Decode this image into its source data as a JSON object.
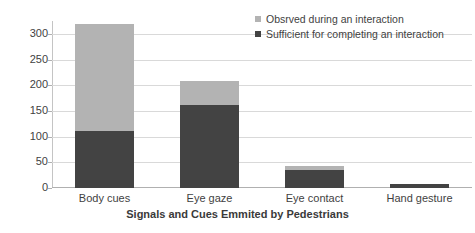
{
  "chart_data": {
    "type": "bar",
    "subtype": "stacked-bar",
    "title": "",
    "xlabel": "Signals and Cues Emmited by Pedestrians",
    "ylabel": "",
    "categories": [
      "Body cues",
      "Eye gaze",
      "Eye contact",
      "Hand gesture"
    ],
    "series": [
      {
        "name": "Sufficient for completing an interaction",
        "color": "#434343",
        "values": [
          110,
          161,
          36,
          7
        ]
      },
      {
        "name": "Obsrved during an interaction",
        "color": "#b3b3b3",
        "values": [
          210,
          47,
          7,
          0
        ]
      }
    ],
    "totals": [
      320,
      208,
      43,
      7
    ],
    "ylim": [
      0,
      325
    ],
    "yticks": [
      0,
      50,
      100,
      150,
      200,
      250,
      300
    ],
    "ytick_labels": [
      "0",
      "50",
      "100",
      "150",
      "200",
      "250",
      "300"
    ],
    "grid": true,
    "legend_position": "top-right",
    "legend_entries": [
      "Obsrved during an interaction",
      "Sufficient for completing an interaction"
    ]
  },
  "legend": {
    "items": [
      {
        "label": "Obsrved during an interaction",
        "color": "#b3b3b3"
      },
      {
        "label": "Sufficient for completing an interaction",
        "color": "#434343"
      }
    ]
  },
  "axis": {
    "x_title": "Signals and Cues Emmited by Pedestrians"
  },
  "colors": {
    "series_light": "#b3b3b3",
    "series_dark": "#434343",
    "gridline": "#d9d9d9",
    "axis": "#b0b0b0",
    "text": "#3f3f3f",
    "background": "#ffffff"
  }
}
